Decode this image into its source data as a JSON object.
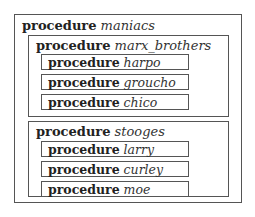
{
  "diagram": {
    "keyword": "procedure",
    "root": {
      "name": "maniacs",
      "children": [
        {
          "name": "marx_brothers",
          "children": [
            {
              "name": "harpo"
            },
            {
              "name": "groucho"
            },
            {
              "name": "chico"
            }
          ]
        },
        {
          "name": "stooges",
          "children": [
            {
              "name": "larry"
            },
            {
              "name": "curley"
            },
            {
              "name": "moe"
            }
          ]
        }
      ]
    }
  }
}
